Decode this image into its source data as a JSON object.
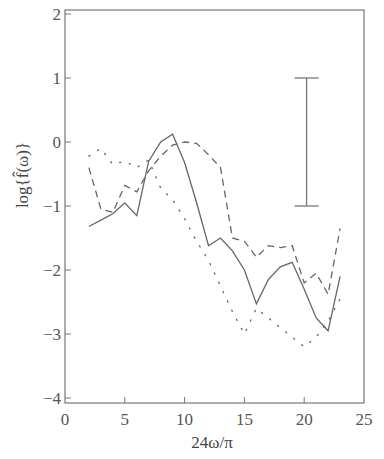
{
  "chart_data": {
    "type": "line",
    "title": "",
    "xlabel": "24ω/π",
    "ylabel": "log{f̂(ω)}",
    "xlim": [
      0,
      25
    ],
    "ylim": [
      -4,
      2
    ],
    "xticks": [
      0,
      5,
      10,
      15,
      20,
      25
    ],
    "yticks": [
      2,
      1,
      0,
      -1,
      -2,
      -3,
      -4
    ],
    "xtick_labels": [
      "0",
      "5",
      "10",
      "15",
      "20",
      "25"
    ],
    "ytick_labels": [
      "2",
      "1",
      "0",
      "−1",
      "−2",
      "−3",
      "−4"
    ],
    "grid": false,
    "legend": null,
    "x": [
      2,
      3,
      4,
      5,
      6,
      7,
      8,
      9,
      10,
      11,
      12,
      13,
      14,
      15,
      16,
      17,
      18,
      19,
      20,
      21,
      22,
      23
    ],
    "series": [
      {
        "name": "solid",
        "style": "solid",
        "values": [
          -1.32,
          -1.22,
          -1.12,
          -0.95,
          -1.15,
          -0.3,
          0.0,
          0.12,
          -0.32,
          -0.95,
          -1.62,
          -1.5,
          -1.7,
          -2.0,
          -2.53,
          -2.15,
          -1.95,
          -1.88,
          -2.3,
          -2.75,
          -2.95,
          -2.1
        ]
      },
      {
        "name": "dashed",
        "style": "dashed",
        "values": [
          -0.4,
          -1.05,
          -1.1,
          -0.68,
          -0.78,
          -0.45,
          -0.22,
          -0.05,
          0.0,
          -0.02,
          -0.2,
          -0.4,
          -1.5,
          -1.55,
          -1.8,
          -1.62,
          -1.65,
          -1.62,
          -2.2,
          -2.05,
          -2.38,
          -1.35
        ]
      },
      {
        "name": "dotted",
        "style": "dotted",
        "values": [
          -0.22,
          -0.1,
          -0.35,
          -0.3,
          -0.4,
          -0.28,
          -0.72,
          -0.9,
          -1.2,
          -1.55,
          -1.85,
          -2.25,
          -2.65,
          -3.0,
          -2.6,
          -2.75,
          -2.9,
          -3.05,
          -3.2,
          -3.05,
          -2.8,
          -2.45
        ]
      }
    ],
    "annotations": [
      {
        "type": "error_bar",
        "x": 20.2,
        "y_low": -1.0,
        "y_high": 1.0
      }
    ]
  },
  "colors": {
    "line": "#666666",
    "frame": "#777777",
    "text": "#555555",
    "background": "#ffffff"
  }
}
